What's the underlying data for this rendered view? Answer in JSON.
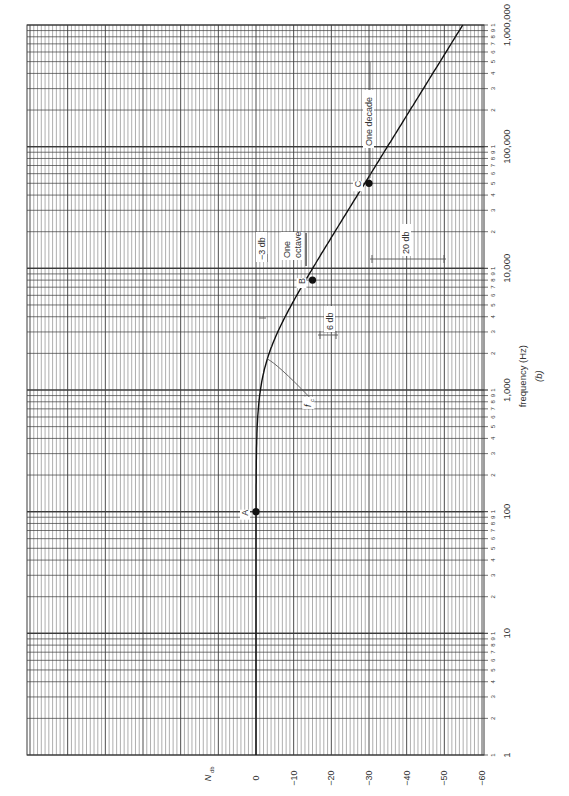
{
  "chart_data": {
    "type": "line",
    "orientation": "rotated-90-ccw",
    "title": "",
    "subtitle": "(b)",
    "xlabel": "frequency (Hz)",
    "ylabel": "N_db",
    "xscale": "log",
    "xlim": [
      1,
      1000000
    ],
    "ylim": [
      -60,
      0
    ],
    "x_major_ticks": [
      "1",
      "10",
      "100",
      "1,000",
      "10,000",
      "100,000",
      "1,000,000"
    ],
    "x_minor_tick_labels": [
      "2",
      "3",
      "4",
      "5",
      "6",
      "7",
      "8",
      "9",
      "1"
    ],
    "y_ticks": [
      "0",
      "-10",
      "-20",
      "-30",
      "-40",
      "-50",
      "-60"
    ],
    "grid": true,
    "series": [
      {
        "name": "Low-pass response",
        "x": [
          1,
          10,
          100,
          300,
          500,
          1000,
          1500,
          1800,
          2500,
          4000,
          8000,
          10000,
          20000,
          50000,
          100000,
          300000,
          1000000
        ],
        "values": [
          0,
          0,
          0,
          -0.1,
          -0.3,
          -1,
          -2.2,
          -3,
          -4.9,
          -7.9,
          -13,
          -14.9,
          -20.9,
          -28.9,
          -34.9,
          -44.4,
          -54.9
        ]
      }
    ],
    "points": [
      {
        "label": "A",
        "x": 100,
        "y": 0
      },
      {
        "label": "B",
        "x": 8000,
        "y": -15
      },
      {
        "label": "C",
        "x": 50000,
        "y": -30
      }
    ],
    "annotations": [
      {
        "text": "f_c",
        "note": "corner frequency, pointer to curve near -3 dB",
        "x": 1800,
        "y": -3
      },
      {
        "text": "-3 db",
        "note": "bracket marking 3 dB drop at corner"
      },
      {
        "text": "One octave",
        "note": "arrow spanning one octave near B"
      },
      {
        "text": "6 db",
        "note": "6 dB per octave marker"
      },
      {
        "text": "20 db",
        "note": "20 dB per decade marker"
      },
      {
        "text": "One decade",
        "note": "arrow spanning one decade above C"
      }
    ]
  },
  "labels": {
    "ylabel_main": "N",
    "ylabel_sub": "db",
    "xlabel": "frequency (Hz)",
    "caption": "(b)",
    "fc_main": "f",
    "fc_sub": "c",
    "minus3": "−3 db",
    "one": "One",
    "octave": "octave",
    "six": "6 db",
    "twenty": "20 db",
    "decade": "One decade",
    "A": "A",
    "B": "B",
    "C": "C"
  },
  "ytick_labels": [
    "0",
    "−10",
    "−20",
    "−30",
    "−40",
    "−50",
    "−60"
  ],
  "xtick_labels": [
    "1",
    "10",
    "100",
    "1,000",
    "10,000",
    "100,000",
    "1,000,000"
  ],
  "colors": {
    "grid": "#3a3a3a",
    "grid_minor": "#6a6a6a",
    "curve": "#111111",
    "text": "#333333"
  }
}
